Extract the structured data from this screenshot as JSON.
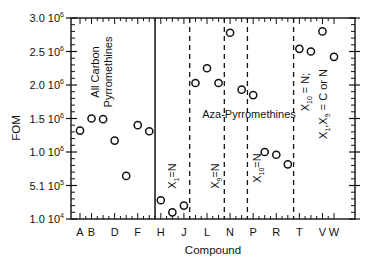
{
  "chart_data": {
    "type": "scatter",
    "title": "",
    "xlabel": "Compound",
    "ylabel": "FOM",
    "ylim": [
      10000,
      3000000
    ],
    "grid": false,
    "legend": null,
    "y_ticks": [
      {
        "value": 3000000,
        "label": "3.0 10",
        "exp": "6"
      },
      {
        "value": 2500000,
        "label": "2.5 10",
        "exp": "6"
      },
      {
        "value": 2000000,
        "label": "2.0 10",
        "exp": "6"
      },
      {
        "value": 1500000,
        "label": "1.5 10",
        "exp": "6"
      },
      {
        "value": 1000000,
        "label": "1.0 10",
        "exp": "6"
      },
      {
        "value": 510000,
        "label": "5.1 10",
        "exp": "5"
      },
      {
        "value": 10000,
        "label": "1.0 10",
        "exp": "4"
      }
    ],
    "categories": [
      "A",
      "B",
      "C",
      "D",
      "E",
      "F",
      "G",
      "H",
      "I",
      "J",
      "K",
      "L",
      "M",
      "N",
      "O",
      "P",
      "Q",
      "R",
      "S",
      "T",
      "U",
      "V",
      "W"
    ],
    "x_tick_labels": [
      "A",
      "B",
      "D",
      "F",
      "H",
      "J",
      "L",
      "N",
      "P",
      "R",
      "T",
      "V",
      "W"
    ],
    "values": [
      1320000,
      1500000,
      1490000,
      1170000,
      650000,
      1400000,
      1310000,
      290000,
      110000,
      210000,
      2030000,
      2250000,
      2030000,
      2780000,
      1930000,
      1850000,
      1000000,
      960000,
      820000,
      2540000,
      2500000,
      2800000,
      2420000
    ],
    "dividers": [
      {
        "after": "G",
        "style": "solid"
      },
      {
        "after": "J",
        "style": "dashed"
      },
      {
        "after": "M",
        "style": "dashed"
      },
      {
        "after": "O",
        "style": "dashed"
      },
      {
        "after": "S",
        "style": "dashed"
      }
    ],
    "annotations": [
      {
        "text_lines": [
          "All Carbon",
          "Pyrromethines"
        ],
        "orientation": "vertical",
        "region": "A-G"
      },
      {
        "text": "Aza-Pyrromethines",
        "orientation": "horizontal",
        "region": "H-S"
      },
      {
        "text": "X1=N",
        "orientation": "vertical",
        "region": "H-J"
      },
      {
        "text": "X9=N",
        "orientation": "vertical",
        "region": "K-N"
      },
      {
        "text": "X10=N",
        "orientation": "vertical",
        "region": "O-S"
      },
      {
        "text_lines": [
          "X10 = N;",
          "X1,X9 = C or N"
        ],
        "orientation": "vertical",
        "region": "T-W"
      }
    ]
  },
  "labels": {
    "ylabel": "FOM",
    "xlabel": "Compound",
    "group_all_carbon_1": "All Carbon",
    "group_all_carbon_2": "Pyrromethines",
    "group_aza": "Aza-Pyrromethines",
    "x1n": "X",
    "x1n_sub": "1",
    "x1n_eq": "=N",
    "x9n": "X",
    "x9n_sub": "9",
    "x9n_eq": "=N",
    "x10n": "X",
    "x10n_sub": "10",
    "x10n_eq": "=N",
    "right_line1_a": "X",
    "right_line1_sub": "10",
    "right_line1_b": " = N;",
    "right_line2_a": "X",
    "right_line2_sub1": "1",
    "right_line2_mid": ",X",
    "right_line2_sub2": "9",
    "right_line2_b": " = C or N"
  }
}
